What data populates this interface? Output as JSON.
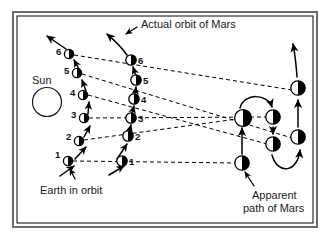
{
  "figure": {
    "background_color": "#ffffff",
    "border_color": "#6b6b72",
    "ink_color": "#000000",
    "frame": {
      "x": 12,
      "y": 11,
      "width": 306,
      "height": 217
    }
  },
  "labels": {
    "actual_orbit": "Actual orbit of Mars",
    "sun": "Sun",
    "earth_in_orbit": "Earth in orbit",
    "apparent_path_line1": "Apparent",
    "apparent_path_line2": "path of Mars"
  },
  "sun": {
    "cx": 47,
    "cy": 102,
    "r": 14.5,
    "label_x": 36,
    "label_y": 82
  },
  "earth_positions": [
    {
      "n": "1",
      "cx": 68,
      "cy": 161,
      "label_x": 57,
      "label_y": 157
    },
    {
      "n": "2",
      "cx": 79,
      "cy": 141,
      "label_x": 68,
      "label_y": 139
    },
    {
      "n": "3",
      "cx": 84,
      "cy": 118,
      "label_x": 73,
      "label_y": 117
    },
    {
      "n": "4",
      "cx": 83,
      "cy": 95,
      "label_x": 72,
      "label_y": 95
    },
    {
      "n": "5",
      "cx": 77,
      "cy": 73,
      "label_x": 66,
      "label_y": 73
    },
    {
      "n": "6",
      "cx": 69,
      "cy": 54,
      "label_x": 58,
      "label_y": 54
    }
  ],
  "mars_positions": [
    {
      "n": "1",
      "cx": 122,
      "cy": 161,
      "label_x": 131,
      "label_y": 165
    },
    {
      "n": "2",
      "cx": 128,
      "cy": 136,
      "label_x": 137,
      "label_y": 139
    },
    {
      "n": "3",
      "cx": 131,
      "cy": 118,
      "label_x": 140,
      "label_y": 122
    },
    {
      "n": "4",
      "cx": 134,
      "cy": 99,
      "label_x": 143,
      "label_y": 102
    },
    {
      "n": "5",
      "cx": 136,
      "cy": 80,
      "label_x": 145,
      "label_y": 83
    },
    {
      "n": "6",
      "cx": 131,
      "cy": 60,
      "label_x": 140,
      "label_y": 63
    }
  ],
  "apparent_positions": [
    {
      "n": "1",
      "cx": 242,
      "cy": 163
    },
    {
      "n": "2",
      "cx": 243,
      "cy": 118
    },
    {
      "n": "3",
      "cx": 273,
      "cy": 117
    },
    {
      "n": "4",
      "cx": 273,
      "cy": 144
    },
    {
      "n": "5",
      "cx": 298,
      "cy": 137
    },
    {
      "n": "6",
      "cx": 298,
      "cy": 88
    }
  ],
  "sight_lines": [
    {
      "from": "earth1",
      "to": "apparent1",
      "x1": 73,
      "y1": 161,
      "x2": 238,
      "y2": 163
    },
    {
      "from": "earth2",
      "to": "apparent2",
      "x1": 84,
      "y1": 140,
      "x2": 238,
      "y2": 119
    },
    {
      "from": "earth3",
      "to": "apparent3",
      "x1": 89,
      "y1": 118,
      "x2": 268,
      "y2": 117
    },
    {
      "from": "earth4",
      "to": "apparent4",
      "x1": 88,
      "y1": 95,
      "x2": 268,
      "y2": 144
    },
    {
      "from": "earth5",
      "to": "apparent5",
      "x1": 82,
      "y1": 74,
      "x2": 293,
      "y2": 137
    },
    {
      "from": "earth6",
      "to": "apparent6",
      "x1": 74,
      "y1": 55,
      "x2": 293,
      "y2": 89
    }
  ],
  "annotations": {
    "actual_orbit_text_x": 141,
    "actual_orbit_text_y": 28,
    "earth_orbit_text_x": 40,
    "earth_orbit_text_y": 192,
    "apparent_text_x": 253,
    "apparent_text_y": 198
  },
  "icon_names": {
    "sun": "sun-icon",
    "earth_body": "earth-body-icon",
    "mars_body": "mars-body-icon",
    "apparent_body": "apparent-mars-body-icon",
    "arrow": "direction-arrow-icon"
  }
}
